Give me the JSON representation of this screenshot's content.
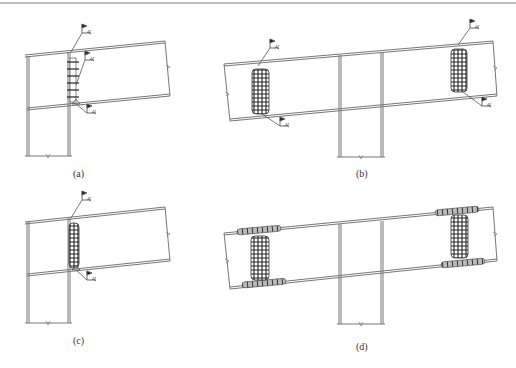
{
  "figure": {
    "panels": [
      {
        "id": "a",
        "label": "(a)",
        "type": "beam-to-column end connection",
        "weld_pattern": "single-row vertical plug welds on web",
        "weld_symbols": 3
      },
      {
        "id": "b",
        "label": "(b)",
        "type": "double-sided beam with continuous column",
        "weld_pattern": "dense grid welds on web near both ends",
        "weld_symbols": 4
      },
      {
        "id": "c",
        "label": "(c)",
        "type": "beam-to-column end connection",
        "weld_pattern": "dense vertical grid weld on web",
        "weld_symbols": 2
      },
      {
        "id": "d",
        "label": "(d)",
        "type": "double-sided beam with continuous column",
        "weld_pattern": "grid welds on web plus flange welds",
        "weld_symbols": 0
      }
    ],
    "colors": {
      "line": "#6e6e6e",
      "weld": "#2a2a2a",
      "border": "#bdbdbd",
      "background": "#ffffff"
    }
  }
}
